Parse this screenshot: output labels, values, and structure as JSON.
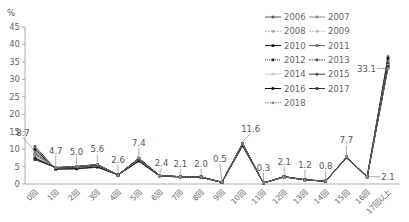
{
  "chart_data": {
    "type": "line",
    "title": "",
    "xlabel": "",
    "ylabel": "%",
    "ylim": [
      0,
      45
    ],
    "yticks": [
      0,
      5,
      10,
      15,
      20,
      25,
      30,
      35,
      40,
      45
    ],
    "grid": false,
    "legend_position": "top-right",
    "categories": [
      "0回",
      "1回",
      "2回",
      "3回",
      "4回",
      "5回",
      "6回",
      "7回",
      "8回",
      "9回",
      "10回",
      "11回",
      "12回",
      "13回",
      "14回",
      "15回",
      "16回",
      "17回以上"
    ],
    "annotated_series": "2018",
    "annotations": [
      8.7,
      4.7,
      5.0,
      5.6,
      2.6,
      7.4,
      2.4,
      2.1,
      2.0,
      0.5,
      11.6,
      0.3,
      2.1,
      1.2,
      0.8,
      7.7,
      2.1,
      33.1
    ],
    "series": [
      {
        "name": "2006",
        "values": [
          10.8,
          4.2,
          4.3,
          4.8,
          2.6,
          6.5,
          2.3,
          2.0,
          1.9,
          0.5,
          10.9,
          0.3,
          2.0,
          1.2,
          0.8,
          7.5,
          2.0,
          36.5
        ]
      },
      {
        "name": "2007",
        "values": [
          10.2,
          4.4,
          4.5,
          5.0,
          2.6,
          6.7,
          2.3,
          2.0,
          1.9,
          0.5,
          11.0,
          0.3,
          2.0,
          1.2,
          0.8,
          7.6,
          2.0,
          36.0
        ]
      },
      {
        "name": "2008",
        "values": [
          9.8,
          4.5,
          4.6,
          5.1,
          2.6,
          6.8,
          2.4,
          2.1,
          2.0,
          0.5,
          11.1,
          0.3,
          2.0,
          1.2,
          0.8,
          7.6,
          2.1,
          35.5
        ]
      },
      {
        "name": "2009",
        "values": [
          9.4,
          4.5,
          4.7,
          5.2,
          2.6,
          6.9,
          2.4,
          2.1,
          2.0,
          0.5,
          11.2,
          0.3,
          2.1,
          1.2,
          0.8,
          7.6,
          2.1,
          35.2
        ]
      },
      {
        "name": "2010",
        "values": [
          9.9,
          4.3,
          4.4,
          4.9,
          2.6,
          6.6,
          2.3,
          2.0,
          1.9,
          0.5,
          11.0,
          0.3,
          2.0,
          1.2,
          0.8,
          7.5,
          2.0,
          36.0
        ]
      },
      {
        "name": "2011",
        "values": [
          9.0,
          4.6,
          4.8,
          5.3,
          2.6,
          7.0,
          2.4,
          2.1,
          2.0,
          0.5,
          11.3,
          0.3,
          2.1,
          1.2,
          0.8,
          7.6,
          2.1,
          34.8
        ]
      },
      {
        "name": "2012",
        "values": [
          8.6,
          4.6,
          4.8,
          5.3,
          2.6,
          7.1,
          2.4,
          2.1,
          2.0,
          0.5,
          11.4,
          0.3,
          2.1,
          1.2,
          0.8,
          7.7,
          2.1,
          34.5
        ]
      },
      {
        "name": "2013",
        "values": [
          8.2,
          4.7,
          4.9,
          5.4,
          2.6,
          7.2,
          2.4,
          2.1,
          2.0,
          0.5,
          11.5,
          0.3,
          2.1,
          1.2,
          0.8,
          7.7,
          2.1,
          34.2
        ]
      },
      {
        "name": "2014",
        "values": [
          7.8,
          4.8,
          5.0,
          5.5,
          2.6,
          7.3,
          2.4,
          2.1,
          2.0,
          0.5,
          11.6,
          0.3,
          2.1,
          1.2,
          0.8,
          7.8,
          2.1,
          34.0
        ]
      },
      {
        "name": "2015",
        "values": [
          7.5,
          4.7,
          5.0,
          5.5,
          2.6,
          7.3,
          2.4,
          2.1,
          2.0,
          0.5,
          11.6,
          0.3,
          2.1,
          1.2,
          0.8,
          7.7,
          2.1,
          33.8
        ]
      },
      {
        "name": "2016",
        "values": [
          7.2,
          4.7,
          5.0,
          5.6,
          2.6,
          7.4,
          2.4,
          2.1,
          2.0,
          0.5,
          11.6,
          0.3,
          2.1,
          1.2,
          0.8,
          7.7,
          2.1,
          33.5
        ]
      },
      {
        "name": "2017",
        "values": [
          7.0,
          4.7,
          5.0,
          5.6,
          2.6,
          7.4,
          2.4,
          2.1,
          2.0,
          0.5,
          11.6,
          0.3,
          2.1,
          1.2,
          0.8,
          7.7,
          2.1,
          33.3
        ]
      },
      {
        "name": "2018",
        "values": [
          8.7,
          4.7,
          5.0,
          5.6,
          2.6,
          7.4,
          2.4,
          2.1,
          2.0,
          0.5,
          11.6,
          0.3,
          2.1,
          1.2,
          0.8,
          7.7,
          2.1,
          33.1
        ]
      }
    ]
  },
  "legend_styles": {
    "2006": {
      "color": "#555555",
      "dash": "",
      "marker": "circle"
    },
    "2007": {
      "color": "#888888",
      "dash": "",
      "marker": "diamond"
    },
    "2008": {
      "color": "#aaaaaa",
      "dash": "2,1",
      "marker": "circle"
    },
    "2009": {
      "color": "#bbbbbb",
      "dash": "2,1",
      "marker": "diamond"
    },
    "2010": {
      "color": "#111111",
      "dash": "",
      "marker": "square"
    },
    "2011": {
      "color": "#666666",
      "dash": "",
      "marker": "circle"
    },
    "2012": {
      "color": "#222222",
      "dash": "1,1",
      "marker": "square"
    },
    "2013": {
      "color": "#444444",
      "dash": "1.5,1",
      "marker": "square"
    },
    "2014": {
      "color": "#cccccc",
      "dash": "",
      "marker": "circle"
    },
    "2015": {
      "color": "#444444",
      "dash": "",
      "marker": "square"
    },
    "2016": {
      "color": "#111111",
      "dash": "",
      "marker": "circle"
    },
    "2017": {
      "color": "#333333",
      "dash": "",
      "marker": "circle"
    },
    "2018": {
      "color": "#888888",
      "dash": "1.5,1",
      "marker": "square"
    }
  }
}
